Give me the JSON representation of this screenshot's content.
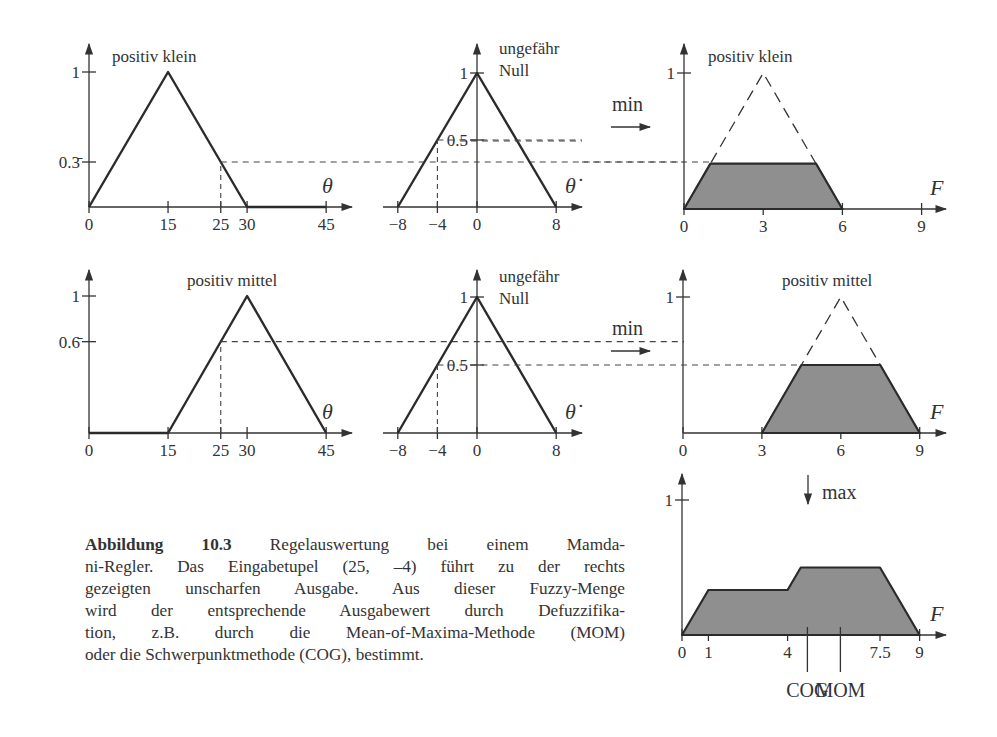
{
  "chart_data": [
    {
      "type": "line",
      "id": "row1-theta",
      "title": "positiv klein",
      "xlabel": "θ",
      "x_ticks": [
        0,
        15,
        25,
        30,
        45
      ],
      "x_tick_labels": [
        "0",
        "15",
        "25",
        "30",
        "45"
      ],
      "y_ticks": [
        0.3333,
        1
      ],
      "y_tick_labels": [
        "0.3̄",
        "1"
      ],
      "series": [
        {
          "name": "positiv klein",
          "x": [
            0,
            15,
            30,
            45
          ],
          "y": [
            0,
            1,
            0,
            0
          ]
        }
      ],
      "annotations": [
        {
          "input": 25,
          "membership": 0.3333
        }
      ]
    },
    {
      "type": "line",
      "id": "row1-thetadot",
      "title": "ungefähr Null",
      "xlabel": "θ̇",
      "x_ticks": [
        -8,
        -4,
        0,
        8
      ],
      "x_tick_labels": [
        "−8",
        "−4",
        "0",
        "8"
      ],
      "y_ticks": [
        0.5,
        1
      ],
      "y_tick_labels": [
        "0.5",
        "1"
      ],
      "series": [
        {
          "name": "ungefähr Null",
          "x": [
            -8,
            0,
            8
          ],
          "y": [
            0,
            1,
            0
          ]
        }
      ],
      "annotations": [
        {
          "input": -4,
          "membership": 0.5
        }
      ]
    },
    {
      "type": "area",
      "id": "row1-output",
      "title": "positiv klein",
      "xlabel": "F",
      "x_ticks": [
        0,
        3,
        6,
        9
      ],
      "x_tick_labels": [
        "0",
        "3",
        "6",
        "9"
      ],
      "y_ticks": [
        1
      ],
      "y_tick_labels": [
        "1"
      ],
      "series": [
        {
          "name": "positiv klein (original)",
          "style": "dashed",
          "x": [
            0,
            3,
            6
          ],
          "y": [
            0,
            1,
            0
          ]
        },
        {
          "name": "clipped (min)",
          "style": "filled",
          "x": [
            0,
            1,
            5,
            6
          ],
          "y": [
            0,
            0.3333,
            0.3333,
            0
          ]
        }
      ],
      "operator": "min"
    },
    {
      "type": "line",
      "id": "row2-theta",
      "title": "positiv mittel",
      "xlabel": "θ",
      "x_ticks": [
        0,
        15,
        25,
        30,
        45
      ],
      "x_tick_labels": [
        "0",
        "15",
        "25",
        "30",
        "45"
      ],
      "y_ticks": [
        0.6667,
        1
      ],
      "y_tick_labels": [
        "0.6̄",
        "1"
      ],
      "series": [
        {
          "name": "positiv mittel",
          "x": [
            0,
            15,
            30,
            45
          ],
          "y": [
            0,
            0,
            1,
            0
          ]
        }
      ],
      "annotations": [
        {
          "input": 25,
          "membership": 0.6667
        }
      ]
    },
    {
      "type": "line",
      "id": "row2-thetadot",
      "title": "ungefähr Null",
      "xlabel": "θ̇",
      "x_ticks": [
        -8,
        -4,
        0,
        8
      ],
      "x_tick_labels": [
        "−8",
        "−4",
        "0",
        "8"
      ],
      "y_ticks": [
        0.5,
        1
      ],
      "y_tick_labels": [
        "0.5",
        "1"
      ],
      "series": [
        {
          "name": "ungefähr Null",
          "x": [
            -8,
            0,
            8
          ],
          "y": [
            0,
            1,
            0
          ]
        }
      ],
      "annotations": [
        {
          "input": -4,
          "membership": 0.5
        }
      ]
    },
    {
      "type": "area",
      "id": "row2-output",
      "title": "positiv mittel",
      "xlabel": "F",
      "x_ticks": [
        0,
        3,
        6,
        9
      ],
      "x_tick_labels": [
        "0",
        "3",
        "6",
        "9"
      ],
      "y_ticks": [
        1
      ],
      "y_tick_labels": [
        "1"
      ],
      "series": [
        {
          "name": "positiv mittel (original)",
          "style": "dashed",
          "x": [
            3,
            6,
            9
          ],
          "y": [
            0,
            1,
            0
          ]
        },
        {
          "name": "clipped (min)",
          "style": "filled",
          "x": [
            3,
            4.5,
            7.5,
            9
          ],
          "y": [
            0,
            0.5,
            0.5,
            0
          ]
        }
      ],
      "operator": "min"
    },
    {
      "type": "area",
      "id": "aggregate-output",
      "title": "",
      "xlabel": "F",
      "x_ticks": [
        0,
        1,
        4,
        7.5,
        9
      ],
      "x_tick_labels": [
        "0",
        "1",
        "4",
        "7.5",
        "9"
      ],
      "y_ticks": [
        1
      ],
      "y_tick_labels": [
        "1"
      ],
      "series": [
        {
          "name": "max aggregation",
          "style": "filled",
          "x": [
            0,
            1,
            4,
            4.5,
            7.5,
            9
          ],
          "y": [
            0,
            0.3333,
            0.3333,
            0.5,
            0.5,
            0
          ]
        }
      ],
      "operator": "max",
      "markers": [
        {
          "label": "COG",
          "x": 4.75
        },
        {
          "label": "MOM",
          "x": 6
        }
      ]
    }
  ],
  "labels": {
    "min": "min",
    "max": "max",
    "cog": "COG",
    "mom": "MOM"
  },
  "caption": {
    "label": "Abbildung 10.3",
    "lines": [
      " Regelauswertung bei einem Mamda-",
      "ni-Regler. Das Eingabetupel (25, –4) führt zu der rechts",
      "gezeigten unscharfen Ausgabe. Aus dieser Fuzzy-Menge",
      "wird der entsprechende Ausgabewert durch Defuzzifika-",
      "tion, z.B. durch die Mean-of-Maxima-Methode (MOM)",
      "oder die Schwerpunktmethode (COG), bestimmt."
    ]
  }
}
